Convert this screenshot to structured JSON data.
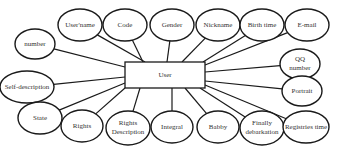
{
  "diagram": {
    "type": "er-diagram",
    "entity": {
      "label": "User",
      "x": 125,
      "y": 62,
      "w": 80,
      "h": 26
    },
    "attributes": [
      {
        "id": "username",
        "label": "User'name",
        "lines": [
          "User'name"
        ],
        "cx": 80,
        "cy": 25,
        "rx": 22,
        "ry": 16,
        "ax": 145,
        "ay": 62
      },
      {
        "id": "code",
        "label": "Code",
        "lines": [
          "Code"
        ],
        "cx": 125,
        "cy": 25,
        "rx": 22,
        "ry": 16,
        "ax": 143,
        "ay": 62
      },
      {
        "id": "gender",
        "label": "Gender",
        "lines": [
          "Gender"
        ],
        "cx": 172,
        "cy": 25,
        "rx": 22,
        "ry": 16,
        "ax": 167,
        "ay": 62
      },
      {
        "id": "nickname",
        "label": "Nickname",
        "lines": [
          "Nickname"
        ],
        "cx": 218,
        "cy": 25,
        "rx": 22,
        "ry": 16,
        "ax": 182,
        "ay": 62
      },
      {
        "id": "birth-time",
        "label": "Birth time",
        "lines": [
          "Birth time"
        ],
        "cx": 262,
        "cy": 25,
        "rx": 22,
        "ry": 16,
        "ax": 203,
        "ay": 62
      },
      {
        "id": "email",
        "label": "E-mail",
        "lines": [
          "E-mail"
        ],
        "cx": 307,
        "cy": 25,
        "rx": 22,
        "ry": 16,
        "ax": 205,
        "ay": 65
      },
      {
        "id": "number",
        "label": "number",
        "lines": [
          "number"
        ],
        "cx": 35,
        "cy": 44,
        "rx": 20,
        "ry": 15,
        "ax": 125,
        "ay": 67
      },
      {
        "id": "qq-number",
        "label": "QQ number",
        "lines": [
          "QQ",
          "number"
        ],
        "cx": 300,
        "cy": 64,
        "rx": 20,
        "ry": 15,
        "ax": 205,
        "ay": 72
      },
      {
        "id": "self-description",
        "label": "Self-description",
        "lines": [
          "Self-description"
        ],
        "cx": 27,
        "cy": 87,
        "rx": 27,
        "ry": 16,
        "ax": 125,
        "ay": 77
      },
      {
        "id": "portrait",
        "label": "Portrait",
        "lines": [
          "Portrait"
        ],
        "cx": 302,
        "cy": 91,
        "rx": 20,
        "ry": 15,
        "ax": 205,
        "ay": 81
      },
      {
        "id": "state",
        "label": "State",
        "lines": [
          "State"
        ],
        "cx": 40,
        "cy": 118,
        "rx": 22,
        "ry": 16,
        "ax": 125,
        "ay": 83
      },
      {
        "id": "rights",
        "label": "Rights",
        "lines": [
          "Rights"
        ],
        "cx": 82,
        "cy": 126,
        "rx": 21,
        "ry": 16,
        "ax": 125,
        "ay": 88
      },
      {
        "id": "rights-description",
        "label": "Rights Description",
        "lines": [
          "Rights",
          "Description"
        ],
        "cx": 128,
        "cy": 128,
        "rx": 22,
        "ry": 17,
        "ax": 140,
        "ay": 88
      },
      {
        "id": "integral",
        "label": "Integral",
        "lines": [
          "Integral"
        ],
        "cx": 172,
        "cy": 127,
        "rx": 21,
        "ry": 16,
        "ax": 172,
        "ay": 88
      },
      {
        "id": "babby",
        "label": "Babby",
        "lines": [
          "Babby"
        ],
        "cx": 218,
        "cy": 127,
        "rx": 21,
        "ry": 16,
        "ax": 185,
        "ay": 88
      },
      {
        "id": "finally-debarkation",
        "label": "Finally debarkation",
        "lines": [
          "Finally",
          "debarkation"
        ],
        "cx": 262,
        "cy": 128,
        "rx": 22,
        "ry": 17,
        "ax": 200,
        "ay": 88
      },
      {
        "id": "registries-time",
        "label": "Registries time",
        "lines": [
          "Registries time"
        ],
        "cx": 306,
        "cy": 127,
        "rx": 23,
        "ry": 16,
        "ax": 205,
        "ay": 85
      }
    ]
  }
}
